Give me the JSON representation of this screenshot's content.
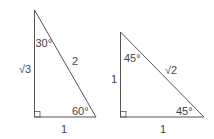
{
  "diagram": {
    "triangles": [
      {
        "type": "30-60-90",
        "angle_top": "30°",
        "angle_bottom_right": "60°",
        "side_vertical": "√3",
        "side_hypotenuse": "2",
        "side_base": "1"
      },
      {
        "type": "45-45-90",
        "angle_top": "45°",
        "angle_bottom_right": "45°",
        "side_vertical": "1",
        "side_hypotenuse": "√2",
        "side_base": "1"
      }
    ],
    "colors": {
      "stroke": "#555555",
      "text": "#444444"
    }
  }
}
